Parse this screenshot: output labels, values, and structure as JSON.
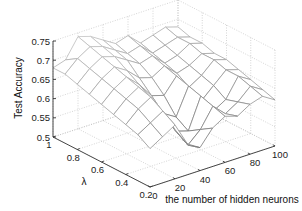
{
  "chart_data": {
    "type": "surface",
    "title": "",
    "xlabel": "the number of hidden neurons",
    "ylabel": "λ",
    "zlabel": "Test  Accuracy",
    "x_ticks": [
      0,
      20,
      40,
      60,
      80,
      100
    ],
    "y_ticks": [
      0.2,
      0.4,
      0.6,
      0.8,
      1
    ],
    "z_ticks": [
      0.5,
      0.55,
      0.6,
      0.65,
      0.7,
      0.75
    ],
    "xlim": [
      0,
      100
    ],
    "ylim": [
      0.2,
      1
    ],
    "zlim": [
      0.5,
      0.75
    ],
    "grid": true,
    "x": [
      0,
      10,
      20,
      30,
      40,
      50,
      60,
      70,
      80,
      90,
      100
    ],
    "y": [
      0.2,
      0.3,
      0.4,
      0.5,
      0.6,
      0.7,
      0.8,
      0.9,
      1.0
    ],
    "z": [
      [
        0.6,
        0.62,
        0.64,
        0.58,
        0.56,
        0.6,
        0.62,
        0.61,
        0.63,
        0.64,
        0.62
      ],
      [
        0.62,
        0.64,
        0.66,
        0.6,
        0.55,
        0.58,
        0.63,
        0.6,
        0.62,
        0.65,
        0.63
      ],
      [
        0.63,
        0.66,
        0.68,
        0.62,
        0.57,
        0.56,
        0.64,
        0.59,
        0.61,
        0.66,
        0.64
      ],
      [
        0.64,
        0.67,
        0.69,
        0.65,
        0.6,
        0.58,
        0.65,
        0.6,
        0.63,
        0.66,
        0.65
      ],
      [
        0.65,
        0.68,
        0.7,
        0.67,
        0.63,
        0.62,
        0.66,
        0.62,
        0.64,
        0.67,
        0.66
      ],
      [
        0.66,
        0.69,
        0.71,
        0.69,
        0.66,
        0.65,
        0.67,
        0.64,
        0.65,
        0.67,
        0.66
      ],
      [
        0.67,
        0.7,
        0.72,
        0.71,
        0.69,
        0.67,
        0.68,
        0.65,
        0.66,
        0.68,
        0.67
      ],
      [
        0.68,
        0.71,
        0.73,
        0.72,
        0.7,
        0.68,
        0.69,
        0.66,
        0.67,
        0.68,
        0.67
      ],
      [
        0.68,
        0.69,
        0.74,
        0.73,
        0.71,
        0.69,
        0.7,
        0.67,
        0.68,
        0.69,
        0.68
      ]
    ]
  },
  "view": {
    "origin_px": [
      150,
      187
    ],
    "x_unit_px": [
      1.25,
      -0.41
    ],
    "y_unit_px": [
      -121.25,
      -62.5
    ],
    "z_unit_px": -384,
    "mesh_color_low": "#6e6e6e",
    "mesh_color_high": "#c8c8c8",
    "grid_color": "#b8b8b8",
    "axis_color": "#333333"
  }
}
